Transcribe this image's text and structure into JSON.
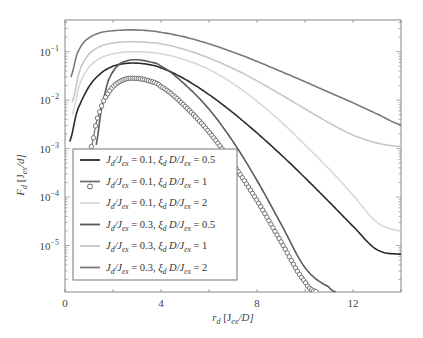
{
  "chart_data": {
    "type": "line",
    "title": "",
    "xlabel": "r_d [J_ex/D]",
    "ylabel": "F_d [J_ex/d]",
    "xscale": "linear",
    "yscale": "log",
    "xlim": [
      0,
      14
    ],
    "ylim": [
      1.1e-06,
      0.45
    ],
    "xticks": [
      0,
      4,
      8,
      12
    ],
    "xtick_labels": [
      "0",
      "4",
      "8",
      "12"
    ],
    "yticks": [
      0.1,
      0.01,
      0.001,
      0.0001,
      1e-05
    ],
    "ytick_labels": [
      "10^-1",
      "10^-2",
      "10^-3",
      "10^-4",
      "10^-5"
    ],
    "grid": false,
    "legend_position": "lower left",
    "series": [
      {
        "name": "J_d/J_ex = 0.1, ξ_d D/J_ex = 0.5",
        "color": "#2b2b2b",
        "marker": "none",
        "x": [
          0.2,
          0.5,
          1.0,
          1.5,
          2.0,
          2.5,
          3.0,
          3.5,
          4.0,
          5.0,
          6.0,
          7.0,
          8.0,
          9.0,
          10.0,
          11.0,
          12.0,
          13.0,
          14.0
        ],
        "y": [
          0.0014,
          0.006,
          0.019,
          0.036,
          0.05,
          0.057,
          0.058,
          0.054,
          0.046,
          0.027,
          0.013,
          0.0055,
          0.0021,
          0.00075,
          0.00025,
          8e-05,
          2.5e-05,
          8.2e-06,
          6.6e-06
        ]
      },
      {
        "name": "J_d/J_ex = 0.1, ξ_d D/J_ex = 1",
        "color": "#6e6e6e",
        "marker": "circle",
        "x": [
          1.1,
          1.3,
          1.6,
          2.0,
          2.5,
          3.0,
          3.5,
          4.0,
          5.0,
          6.0,
          7.0,
          8.0,
          9.0,
          10.0,
          10.5
        ],
        "y": [
          0.0011,
          0.0035,
          0.0095,
          0.019,
          0.027,
          0.028,
          0.025,
          0.019,
          0.0075,
          0.0022,
          0.00048,
          8.5e-05,
          1.2e-05,
          1.8e-06,
          1.1e-06
        ]
      },
      {
        "name": "J_d/J_ex = 0.1, ξ_d D/J_ex = 2",
        "color": "#d8d8d8",
        "marker": "none",
        "x": [
          0.3,
          0.6,
          1.0,
          1.5,
          2.0,
          2.5,
          3.0,
          3.5,
          4.0,
          5.0,
          6.0,
          7.0,
          8.0,
          9.0,
          10.0,
          11.0,
          12.0,
          13.0,
          14.0
        ],
        "y": [
          0.005,
          0.021,
          0.048,
          0.075,
          0.09,
          0.098,
          0.1,
          0.097,
          0.09,
          0.068,
          0.043,
          0.022,
          0.0095,
          0.0036,
          0.0012,
          0.00038,
          0.00011,
          3e-05,
          2e-05
        ]
      },
      {
        "name": "J_d/J_ex = 0.3, ξ_d D/J_ex = 0.5",
        "color": "#5a5a5a",
        "marker": "none",
        "x": [
          1.3,
          1.5,
          1.8,
          2.2,
          2.6,
          3.0,
          3.5,
          4.0,
          5.0,
          6.0,
          7.0,
          8.0,
          9.0,
          10.0,
          11.0,
          11.3
        ],
        "y": [
          0.0012,
          0.006,
          0.025,
          0.052,
          0.065,
          0.068,
          0.062,
          0.05,
          0.021,
          0.0065,
          0.0014,
          0.00022,
          2.8e-05,
          3.5e-06,
          1.4e-06,
          1.1e-06
        ]
      },
      {
        "name": "J_d/J_ex = 0.3, ξ_d D/J_ex = 1",
        "color": "#c6c6c6",
        "marker": "none",
        "x": [
          0.3,
          0.6,
          1.0,
          1.5,
          2.0,
          2.5,
          3.0,
          3.5,
          4.0,
          5.0,
          6.0,
          7.0,
          8.0,
          9.0,
          10.0,
          11.0,
          12.0,
          13.0,
          14.0
        ],
        "y": [
          0.009,
          0.04,
          0.09,
          0.13,
          0.15,
          0.16,
          0.16,
          0.155,
          0.145,
          0.11,
          0.074,
          0.045,
          0.025,
          0.013,
          0.0066,
          0.0034,
          0.0019,
          0.0013,
          0.0011
        ]
      },
      {
        "name": "J_d/J_ex = 0.3, ξ_d D/J_ex = 2",
        "color": "#7a7a7a",
        "marker": "none",
        "x": [
          0.25,
          0.5,
          0.8,
          1.2,
          1.6,
          2.0,
          2.5,
          3.0,
          3.5,
          4.0,
          5.0,
          6.0,
          7.0,
          8.0,
          9.0,
          10.0,
          11.0,
          12.0,
          13.0,
          14.0
        ],
        "y": [
          0.03,
          0.09,
          0.16,
          0.22,
          0.255,
          0.27,
          0.28,
          0.28,
          0.27,
          0.25,
          0.2,
          0.145,
          0.098,
          0.063,
          0.039,
          0.024,
          0.0145,
          0.0088,
          0.0052,
          0.0031
        ]
      }
    ]
  },
  "axes": {
    "x_label_main": "r",
    "x_label_sub": "d",
    "x_label_rest": " [J",
    "x_label_sub2": "ex",
    "x_label_end": "/D]",
    "y_label_main": "F",
    "y_label_sub": "d",
    "y_label_rest": " [J",
    "y_label_sub2": "ex",
    "y_label_end": "/d]"
  },
  "legend": {
    "entries": [
      {
        "jd": "0.1",
        "xi": "0.5"
      },
      {
        "jd": "0.1",
        "xi": "1"
      },
      {
        "jd": "0.1",
        "xi": "2"
      },
      {
        "jd": "0.3",
        "xi": "0.5"
      },
      {
        "jd": "0.3",
        "xi": "1"
      },
      {
        "jd": "0.3",
        "xi": "2"
      }
    ]
  }
}
